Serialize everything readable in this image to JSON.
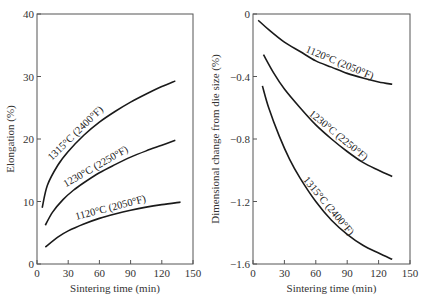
{
  "chart_data": [
    {
      "type": "line",
      "title": "",
      "xlabel": "Sintering time (min)",
      "ylabel": "Elongation (%)",
      "xlim": [
        0,
        150
      ],
      "ylim": [
        0,
        40
      ],
      "xticks": [
        0,
        30,
        60,
        90,
        120,
        150
      ],
      "yticks": [
        0,
        10,
        20,
        30,
        40
      ],
      "grid": false,
      "series": [
        {
          "name": "1315°C (2400°F)",
          "x": [
            5,
            10,
            20,
            30,
            45,
            60,
            75,
            90,
            105,
            120,
            133
          ],
          "y": [
            9.0,
            12.6,
            15.8,
            18.0,
            20.6,
            22.7,
            24.4,
            25.9,
            27.2,
            28.4,
            29.3
          ]
        },
        {
          "name": "1230°C (2250°F)",
          "x": [
            8,
            15,
            25,
            35,
            45,
            60,
            75,
            90,
            105,
            120,
            133
          ],
          "y": [
            6.2,
            8.3,
            10.3,
            11.8,
            13.0,
            14.6,
            15.9,
            17.1,
            18.1,
            19.0,
            19.8
          ]
        },
        {
          "name": "1120°C (2050°F)",
          "x": [
            8,
            20,
            30,
            45,
            60,
            75,
            90,
            105,
            120,
            138
          ],
          "y": [
            2.7,
            4.3,
            5.3,
            6.4,
            7.3,
            8.0,
            8.6,
            9.1,
            9.5,
            9.9
          ]
        }
      ]
    },
    {
      "type": "line",
      "title": "",
      "xlabel": "Sintering time (min)",
      "ylabel": "Dimensional change from die size (%)",
      "xlim": [
        0,
        150
      ],
      "ylim": [
        -1.6,
        0
      ],
      "xticks": [
        0,
        30,
        60,
        90,
        120,
        150
      ],
      "yticks": [
        0,
        -0.4,
        -0.8,
        -1.2,
        -1.6
      ],
      "ytick_labels": [
        "0",
        "−0.4",
        "−0.8",
        "−1.2",
        "−1.6"
      ],
      "grid": false,
      "series": [
        {
          "name": "1120°C (2050°F)",
          "x": [
            5,
            15,
            30,
            45,
            60,
            75,
            90,
            105,
            120,
            133
          ],
          "y": [
            -0.04,
            -0.1,
            -0.18,
            -0.24,
            -0.3,
            -0.34,
            -0.38,
            -0.41,
            -0.435,
            -0.45
          ]
        },
        {
          "name": "1230°C (2250°F)",
          "x": [
            10,
            20,
            30,
            45,
            60,
            75,
            90,
            105,
            120,
            133
          ],
          "y": [
            -0.26,
            -0.38,
            -0.48,
            -0.6,
            -0.71,
            -0.8,
            -0.88,
            -0.95,
            -1.0,
            -1.04
          ]
        },
        {
          "name": "1315°C (2400°F)",
          "x": [
            9,
            15,
            25,
            35,
            45,
            60,
            75,
            90,
            105,
            120,
            133
          ],
          "y": [
            -0.46,
            -0.6,
            -0.78,
            -0.93,
            -1.05,
            -1.2,
            -1.32,
            -1.41,
            -1.48,
            -1.53,
            -1.57
          ]
        }
      ]
    }
  ]
}
